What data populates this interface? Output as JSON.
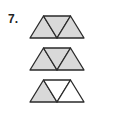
{
  "problem": {
    "number": "7."
  },
  "colors": {
    "shade": "#d9d9d9",
    "stroke": "#2a2a2a",
    "empty": "#ffffff"
  },
  "figures": [
    {
      "name": "figure-1",
      "shaded": [
        true,
        true,
        true
      ]
    },
    {
      "name": "figure-2",
      "shaded": [
        true,
        true,
        true
      ]
    },
    {
      "name": "figure-3",
      "shaded": [
        true,
        false,
        false
      ]
    }
  ]
}
